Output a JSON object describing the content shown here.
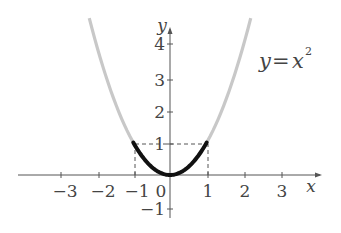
{
  "chart_data": {
    "type": "line",
    "title": "",
    "function": "y=x^2",
    "annotation": "y=x²",
    "xlabel": "x",
    "ylabel": "y",
    "xlim": [
      -4.1,
      4.1
    ],
    "ylim": [
      -1.3,
      4.5
    ],
    "x_ticks": [
      -3,
      -2,
      -1,
      1,
      2,
      3
    ],
    "x_tick_labels": [
      "−3",
      "−2",
      "−1",
      "1",
      "2",
      "3"
    ],
    "y_ticks": [
      4,
      3,
      2,
      1,
      -1
    ],
    "y_tick_labels": [
      "4",
      "3",
      "2",
      "1",
      "−1"
    ],
    "origin_label": "0",
    "grid": false,
    "series": [
      {
        "name": "y=x^2 (full)",
        "x_range": [
          -2.2,
          2.2
        ],
        "color": "#c8c8c8",
        "style": "solid-thick"
      },
      {
        "name": "y=x^2 on [-1,1]",
        "x_range": [
          -1,
          1
        ],
        "color": "#111111",
        "style": "solid-bold"
      }
    ],
    "guides": [
      {
        "type": "dashed",
        "from": [
          -1,
          0
        ],
        "to": [
          -1,
          1
        ]
      },
      {
        "type": "dashed",
        "from": [
          1,
          0
        ],
        "to": [
          1,
          1
        ]
      },
      {
        "type": "dashed",
        "from": [
          -1,
          1
        ],
        "to": [
          1,
          1
        ]
      }
    ]
  },
  "labels": {
    "x_axis": "x",
    "y_axis": "y",
    "origin": "0",
    "equation_lhs": "y",
    "equation_eq": "=",
    "equation_var": "x",
    "equation_exp": "2",
    "xt_m3": "−3",
    "xt_m2": "−2",
    "xt_m1": "−1",
    "xt_1": "1",
    "xt_2": "2",
    "xt_3": "3",
    "yt_4": "4",
    "yt_3": "3",
    "yt_2": "2",
    "yt_1": "1",
    "yt_m1": "−1"
  },
  "colors": {
    "axis": "#555555",
    "curve_full": "#c8c8c8",
    "curve_highlight": "#111111",
    "dashed": "#555555"
  }
}
